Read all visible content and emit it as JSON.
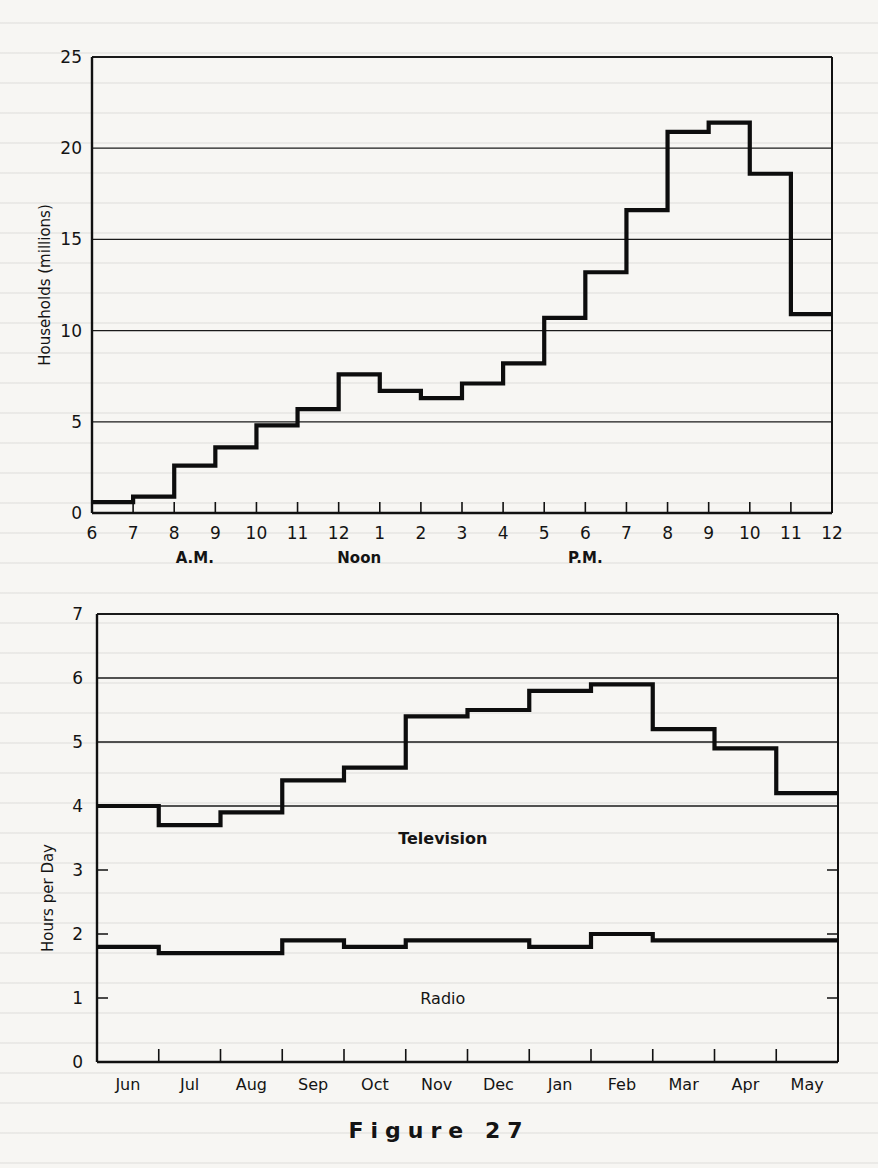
{
  "caption": "Figure 27",
  "chart_data": [
    {
      "type": "line",
      "style": "step",
      "title": "",
      "xlabel": "",
      "ylabel": "Households (millions)",
      "ylim": [
        0,
        25
      ],
      "yticks": [
        0,
        5,
        10,
        15,
        20,
        25
      ],
      "grid": true,
      "x_tick_labels": [
        "6",
        "7",
        "8",
        "9",
        "10",
        "11",
        "12",
        "1",
        "2",
        "3",
        "4",
        "5",
        "6",
        "7",
        "8",
        "9",
        "10",
        "11",
        "12"
      ],
      "x_sublabels": [
        {
          "text": "A.M.",
          "at_hour_index": 2.5
        },
        {
          "text": "Noon",
          "at_hour_index": 6.5
        },
        {
          "text": "P.M.",
          "at_hour_index": 12
        }
      ],
      "categories": [
        "6-7 AM",
        "7-8 AM",
        "8-9 AM",
        "9-10 AM",
        "10-11 AM",
        "11-12 AM",
        "12-1 PM",
        "1-2 PM",
        "2-3 PM",
        "3-4 PM",
        "4-5 PM",
        "5-6 PM",
        "6-7 PM",
        "7-8 PM",
        "8-9 PM",
        "9-10 PM",
        "10-11 PM",
        "11-12 PM"
      ],
      "series": [
        {
          "name": "Households viewing",
          "values": [
            0.6,
            0.9,
            2.6,
            3.6,
            4.8,
            5.7,
            7.6,
            6.7,
            6.3,
            7.1,
            8.2,
            10.7,
            13.2,
            16.6,
            20.9,
            21.4,
            18.6,
            10.9
          ]
        }
      ]
    },
    {
      "type": "line",
      "style": "step",
      "title": "",
      "xlabel": "",
      "ylabel": "Hours per Day",
      "ylim": [
        0,
        7
      ],
      "yticks": [
        0,
        1,
        2,
        3,
        4,
        5,
        6,
        7
      ],
      "grid": true,
      "categories": [
        "Jun",
        "Jul",
        "Aug",
        "Sep",
        "Oct",
        "Nov",
        "Dec",
        "Jan",
        "Feb",
        "Mar",
        "Apr",
        "May"
      ],
      "series": [
        {
          "name": "Television",
          "values": [
            4.0,
            3.7,
            3.9,
            4.4,
            4.6,
            5.4,
            5.5,
            5.8,
            5.9,
            5.2,
            4.9,
            4.2
          ]
        },
        {
          "name": "Radio",
          "values": [
            1.8,
            1.7,
            1.7,
            1.9,
            1.8,
            1.9,
            1.9,
            1.8,
            2.0,
            1.9,
            1.9,
            1.9
          ]
        }
      ],
      "annotations": [
        {
          "text": "Television",
          "x_index": 5.6,
          "y": 3.5
        },
        {
          "text": "Radio",
          "x_index": 5.6,
          "y": 1.0
        }
      ]
    }
  ]
}
